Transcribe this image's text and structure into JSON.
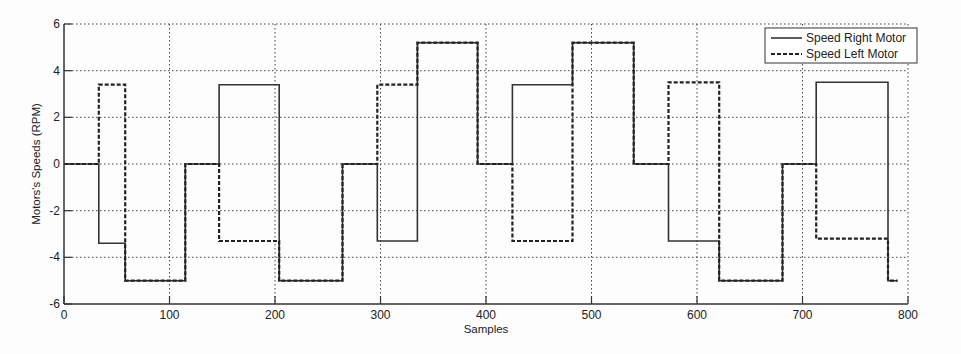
{
  "chart_data": {
    "type": "line",
    "subtype": "step",
    "title": "",
    "xlabel": "Samples",
    "ylabel": "Motors's Speeds (RPM)",
    "xlim": [
      0,
      800
    ],
    "ylim": [
      -6,
      6
    ],
    "xticks": [
      0,
      100,
      200,
      300,
      400,
      500,
      600,
      700,
      800
    ],
    "yticks": [
      -6,
      -4,
      -2,
      0,
      2,
      4,
      6
    ],
    "xtick_labels": [
      "0",
      "100",
      "200",
      "300",
      "400",
      "500",
      "600",
      "700",
      "800"
    ],
    "ytick_labels": [
      "-6",
      "-4",
      "-2",
      "0",
      "2",
      "4",
      "6"
    ],
    "grid": true,
    "grid_style": "dotted",
    "legend_position": "upper right",
    "legend": [
      "Speed Right Motor",
      "Speed Left Motor"
    ],
    "series": [
      {
        "name": "Speed Right Motor",
        "line_style": "solid",
        "color": "#333333",
        "x": [
          0,
          33,
          33,
          58,
          58,
          115,
          115,
          147,
          147,
          204,
          204,
          264,
          264,
          297,
          297,
          335,
          335,
          392,
          392,
          425,
          425,
          482,
          482,
          540,
          540,
          573,
          573,
          621,
          621,
          681,
          681,
          713,
          713,
          781,
          781,
          790
        ],
        "values": [
          0,
          0,
          -3.4,
          -3.4,
          -5.0,
          -5.0,
          0,
          0,
          3.4,
          3.4,
          -5.0,
          -5.0,
          0,
          0,
          -3.3,
          -3.3,
          5.2,
          5.2,
          0,
          0,
          3.4,
          3.4,
          5.2,
          5.2,
          0,
          0,
          -3.3,
          -3.3,
          -5.0,
          -5.0,
          0,
          0,
          3.5,
          3.5,
          -5.0,
          -5.0
        ]
      },
      {
        "name": "Speed Left Motor",
        "line_style": "dashed",
        "color": "#222222",
        "x": [
          0,
          33,
          33,
          58,
          58,
          115,
          115,
          147,
          147,
          204,
          204,
          264,
          264,
          297,
          297,
          335,
          335,
          392,
          392,
          425,
          425,
          482,
          482,
          540,
          540,
          573,
          573,
          621,
          621,
          681,
          681,
          713,
          713,
          781,
          781,
          790
        ],
        "values": [
          0,
          0,
          3.4,
          3.4,
          -5.0,
          -5.0,
          0,
          0,
          -3.3,
          -3.3,
          -5.0,
          -5.0,
          0,
          0,
          3.4,
          3.4,
          5.2,
          5.2,
          0,
          0,
          -3.3,
          -3.3,
          5.2,
          5.2,
          0,
          0,
          3.5,
          3.5,
          -5.0,
          -5.0,
          0,
          0,
          -3.2,
          -3.2,
          -5.0,
          -5.0
        ]
      }
    ]
  },
  "layout": {
    "plot_left": 64,
    "plot_top": 24,
    "plot_right": 908,
    "plot_bottom": 304
  },
  "colors": {
    "axis": "#333333",
    "grid": "#444444",
    "background": "#fdfdfd"
  }
}
